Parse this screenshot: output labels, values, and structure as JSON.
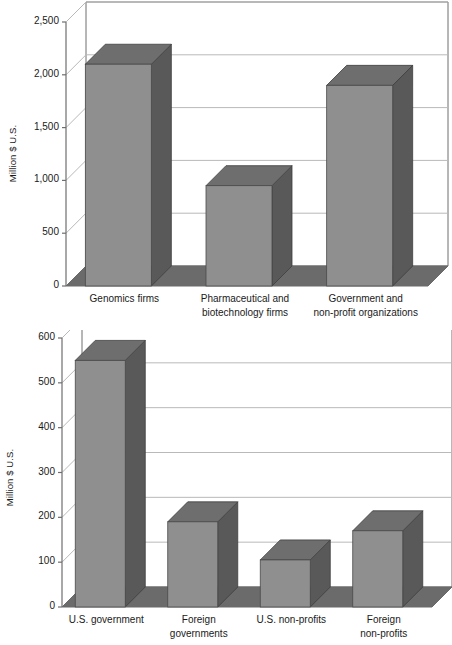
{
  "figure": {
    "background_color": "#ffffff",
    "bar_front_color": "#8f8f8f",
    "bar_side_color": "#595959",
    "bar_top_color": "#6e6e6e",
    "floor_color": "#6b6b6b",
    "wall_color": "#ffffff",
    "gridline_color": "#b9b9b9",
    "axis_color": "#6e6e6e",
    "text_color": "#1a1a1a"
  },
  "charts": [
    {
      "id": "top",
      "axis_title": "Million $ U.S.",
      "yticks": [
        "0",
        "500",
        "1,000",
        "1,500",
        "2,000",
        "2,500"
      ],
      "categories": [
        "Genomics firms",
        "Pharmaceutical and\nbiotechnology firms",
        "Government and\nnon-profit organizations"
      ],
      "values": [
        2100,
        950,
        1900
      ]
    },
    {
      "id": "bottom",
      "axis_title": "Million $ U.S.",
      "yticks": [
        "0",
        "100",
        "200",
        "300",
        "400",
        "500",
        "600"
      ],
      "categories": [
        "U.S. government",
        "Foreign\ngovernments",
        "U.S. non-profits",
        "Foreign\nnon-profits"
      ],
      "values": [
        550,
        190,
        105,
        170
      ]
    }
  ],
  "chart_data": [
    {
      "type": "bar",
      "title": "",
      "xlabel": "",
      "ylabel": "Million $ U.S.",
      "categories": [
        "Genomics firms",
        "Pharmaceutical and biotechnology firms",
        "Government and non-profit organizations"
      ],
      "values": [
        2100,
        950,
        1900
      ],
      "ylim": [
        0,
        2500
      ],
      "ytick_values": [
        0,
        500,
        1000,
        1500,
        2000,
        2500
      ],
      "ytick_labels": [
        "0",
        "500",
        "1,000",
        "1,500",
        "2,000",
        "2,500"
      ],
      "grid": true,
      "legend": "none",
      "style": "3d-bar"
    },
    {
      "type": "bar",
      "title": "",
      "xlabel": "",
      "ylabel": "Million $ U.S.",
      "categories": [
        "U.S. government",
        "Foreign governments",
        "U.S. non-profits",
        "Foreign non-profits"
      ],
      "values": [
        550,
        190,
        105,
        170
      ],
      "ylim": [
        0,
        600
      ],
      "ytick_values": [
        0,
        100,
        200,
        300,
        400,
        500,
        600
      ],
      "ytick_labels": [
        "0",
        "100",
        "200",
        "300",
        "400",
        "500",
        "600"
      ],
      "grid": true,
      "legend": "none",
      "style": "3d-bar"
    }
  ]
}
